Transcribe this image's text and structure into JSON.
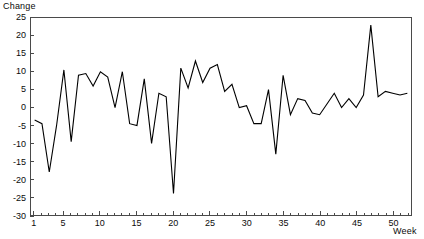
{
  "chart_data": {
    "type": "line",
    "title": "",
    "xlabel": "Week",
    "ylabel": "Change",
    "xlim": [
      0.5,
      52.5
    ],
    "ylim": [
      -30,
      25
    ],
    "grid": false,
    "legend": null,
    "y_ticks": [
      25,
      20,
      15,
      10,
      5,
      0,
      -5,
      -10,
      -15,
      -20,
      -25,
      -30
    ],
    "y_tick_labels": [
      "25",
      "20",
      "15",
      "10",
      "5",
      "0",
      "-5",
      "-10",
      "-15",
      "-20",
      "-25",
      "-30"
    ],
    "x_ticks": [
      1,
      5,
      10,
      15,
      20,
      25,
      30,
      35,
      40,
      45,
      50
    ],
    "x_tick_labels": [
      "1",
      "5",
      "10",
      "15",
      "20",
      "25",
      "30",
      "35",
      "40",
      "45",
      "50"
    ],
    "x_minor_tick_step": 1,
    "line_color": "#000000",
    "series_name": "Change",
    "x": [
      1,
      2,
      3,
      4,
      5,
      6,
      7,
      8,
      9,
      10,
      11,
      12,
      13,
      14,
      15,
      16,
      17,
      18,
      19,
      20,
      21,
      22,
      23,
      24,
      25,
      26,
      27,
      28,
      29,
      30,
      31,
      32,
      33,
      34,
      35,
      36,
      37,
      38,
      39,
      40,
      41,
      42,
      43,
      44,
      45,
      46,
      47,
      48,
      49,
      50,
      51,
      52
    ],
    "values": [
      -3.5,
      -4.5,
      -18.0,
      -5.0,
      10.5,
      -9.5,
      9.0,
      9.5,
      6.0,
      10.0,
      8.5,
      0.0,
      10.0,
      -4.5,
      -5.0,
      8.0,
      -10.0,
      4.0,
      3.0,
      -24.0,
      11.0,
      5.5,
      13.0,
      7.0,
      11.0,
      12.0,
      4.5,
      6.5,
      0.0,
      0.5,
      -4.5,
      -4.5,
      5.0,
      -13.0,
      9.0,
      -2.0,
      2.5,
      2.0,
      -1.5,
      -2.0,
      1.0,
      4.0,
      0.0,
      2.5,
      0.0,
      3.5,
      23.0,
      3.0,
      4.5,
      4.0,
      3.5,
      4.0
    ]
  }
}
